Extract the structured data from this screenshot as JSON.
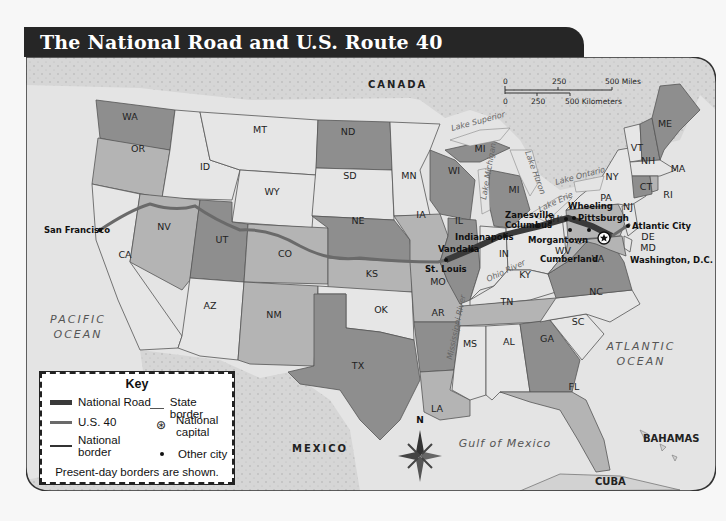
{
  "title": "The National Road and U.S. Route 40",
  "colors": {
    "title_bar": "#262626",
    "national_road": "#3a3a3a",
    "us40": "#6a6a6a",
    "ocean": "#e4e4e4",
    "land_foreign": "#d2d2d2",
    "state_dark": "#8e8e8e",
    "state_mid": "#b4b4b4",
    "state_light": "#e6e6e6"
  },
  "scale": {
    "miles_ticks": [
      "0",
      "250",
      "500 Miles"
    ],
    "km_ticks": [
      "0",
      "250",
      "500 Kilometers"
    ]
  },
  "countries": {
    "canada": "CANADA",
    "mexico": "MEXICO",
    "bahamas": "BAHAMAS",
    "cuba": "CUBA"
  },
  "oceans": {
    "pacific_1": "PACIFIC",
    "pacific_2": "OCEAN",
    "atlantic_1": "ATLANTIC",
    "atlantic_2": "OCEAN",
    "gulf": "Gulf of Mexico"
  },
  "water_labels": {
    "lake_superior": "Lake Superior",
    "lake_michigan": "Lake Michigan",
    "lake_huron": "Lake Huron",
    "lake_erie": "Lake Erie",
    "lake_ontario": "Lake Ontario",
    "ohio_river": "Ohio River",
    "mississippi_river": "Mississippi River"
  },
  "states": {
    "WA": "WA",
    "OR": "OR",
    "CA": "CA",
    "ID": "ID",
    "NV": "NV",
    "MT": "MT",
    "WY": "WY",
    "UT": "UT",
    "AZ": "AZ",
    "CO": "CO",
    "NM": "NM",
    "ND": "ND",
    "SD": "SD",
    "NE": "NE",
    "KS": "KS",
    "OK": "OK",
    "TX": "TX",
    "MN": "MN",
    "IA": "IA",
    "MO": "MO",
    "AR": "AR",
    "LA": "LA",
    "WI": "WI",
    "IL": "IL",
    "MI_UP": "MI",
    "MI": "MI",
    "IN": "IN",
    "OH": "OH",
    "KY": "KY",
    "TN": "TN",
    "MS": "MS",
    "AL": "AL",
    "GA": "GA",
    "FL": "FL",
    "SC": "SC",
    "NC": "NC",
    "VA": "VA",
    "WV": "WV",
    "PA": "PA",
    "NY": "NY",
    "VT": "VT",
    "NH": "NH",
    "ME": "ME",
    "MA": "MA",
    "CT": "CT",
    "RI": "RI",
    "NJ": "NJ",
    "DE": "DE",
    "MD": "MD"
  },
  "cities": {
    "san_francisco": "San Francisco",
    "st_louis": "St. Louis",
    "vandalia": "Vandalia",
    "indianapolis": "Indianapolis",
    "columbus": "Columbus",
    "zanesville": "Zanesville",
    "wheeling": "Wheeling",
    "pittsburgh": "Pittsburgh",
    "morgantown": "Morgantown",
    "cumberland": "Cumberland",
    "atlantic_city": "Atlantic City",
    "washington_dc": "Washington, D.C."
  },
  "compass": {
    "north": "N"
  },
  "key": {
    "title": "Key",
    "national_road": "National Road",
    "us40": "U.S. 40",
    "national_border_1": "National",
    "national_border_2": "border",
    "state_border": "State border",
    "national_capital_1": "National",
    "national_capital_2": "capital",
    "other_city": "Other city",
    "note": "Present-day borders are shown."
  }
}
